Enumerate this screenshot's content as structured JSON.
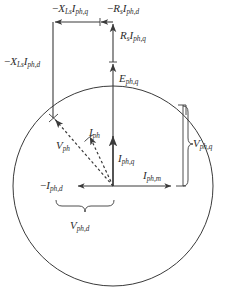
{
  "figure": {
    "type": "phasor-diagram",
    "background_color": "#ffffff",
    "stroke_color": "#3a3a3a"
  },
  "geometry": {
    "width": 229,
    "height": 302,
    "origin": {
      "x": 113,
      "y": 186
    },
    "circle": {
      "cx": 113,
      "cy": 186,
      "r": 100
    },
    "emf_tip": {
      "x": 113,
      "y": 22
    },
    "voltage_tip": {
      "x": 53,
      "y": 118
    },
    "left_vertical_x": 53,
    "top_horizontal_y": 22,
    "rs_iq_split_y": 62,
    "current_tip_y": 134,
    "neg_id_tip_x": 76,
    "im_tip_x": 173
  },
  "labels": {
    "xls_iq": {
      "op": "−",
      "sym": "X",
      "sym_sub": "Ls",
      "sym2": "I",
      "sym2_sub": "ph,q",
      "x": 57,
      "y": 5
    },
    "rs_id": {
      "op": "−",
      "sym": "R",
      "sym_sub": "s",
      "sym2": "I",
      "sym2_sub": "ph,d",
      "x": 110,
      "y": 5
    },
    "rs_iq": {
      "op": "",
      "sym": "R",
      "sym_sub": "s",
      "sym2": "I",
      "sym2_sub": "ph,q",
      "x": 120,
      "y": 30
    },
    "eph_q": {
      "op": "",
      "sym": "E",
      "sym_sub": "ph,q",
      "sym2": "",
      "sym2_sub": "",
      "x": 119,
      "y": 73
    },
    "xls_id": {
      "op": "−",
      "sym": "X",
      "sym_sub": "Ls",
      "sym2": "I",
      "sym2_sub": "ph,d",
      "x": 5,
      "y": 55
    },
    "vph": {
      "op": "",
      "sym": "V",
      "sym_sub": "ph",
      "sym2": "",
      "sym2_sub": "",
      "x": 58,
      "y": 140
    },
    "iph": {
      "op": "",
      "sym": "I",
      "sym_sub": "ph",
      "sym2": "",
      "sym2_sub": "",
      "x": 90,
      "y": 128
    },
    "iph_q": {
      "op": "",
      "sym": "I",
      "sym_sub": "ph,q",
      "sym2": "",
      "sym2_sub": "",
      "x": 118,
      "y": 155
    },
    "iph_m": {
      "op": "",
      "sym": "I",
      "sym_sub": "ph,m",
      "sym2": "",
      "sym2_sub": "",
      "x": 145,
      "y": 172
    },
    "neg_iph_d": {
      "op": "−",
      "sym": "I",
      "sym_sub": "ph,d",
      "sym2": "",
      "sym2_sub": "",
      "x": 43,
      "y": 182
    },
    "vph_q": {
      "op": "",
      "sym": "V",
      "sym_sub": "ph,q",
      "sym2": "",
      "sym2_sub": "",
      "x": 192,
      "y": 140
    },
    "vph_d": {
      "op": "",
      "sym": "V",
      "sym_sub": "ph,d",
      "sym2": "",
      "sym2_sub": "",
      "x": 72,
      "y": 222
    }
  },
  "vectors": [
    {
      "name": "eph_q_axis",
      "kind": "solid-arrow",
      "label_key": "eph_q"
    },
    {
      "name": "rs_iq_segment",
      "kind": "solid-arrow",
      "label_key": "rs_iq"
    },
    {
      "name": "xls_id_segment",
      "kind": "solid-line",
      "label_key": "xls_id"
    },
    {
      "name": "xls_iq_segment",
      "kind": "solid-arrow",
      "label_key": "xls_iq"
    },
    {
      "name": "rs_id_segment",
      "kind": "solid-arrow",
      "label_key": "rs_id"
    },
    {
      "name": "vph_phasor",
      "kind": "dashed-arrow",
      "label_key": "vph"
    },
    {
      "name": "iph_phasor",
      "kind": "dashed-arrow",
      "label_key": "iph"
    },
    {
      "name": "iph_q_component",
      "kind": "solid-arrow",
      "label_key": "iph_q"
    },
    {
      "name": "iph_m_component",
      "kind": "solid-arrow",
      "label_key": "iph_m"
    },
    {
      "name": "neg_iph_d_component",
      "kind": "solid-arrow",
      "label_key": "neg_iph_d"
    }
  ],
  "braces": [
    {
      "name": "vph_q_brace",
      "orientation": "vertical",
      "label_key": "vph_q"
    },
    {
      "name": "vph_d_brace",
      "orientation": "horizontal",
      "label_key": "vph_d"
    }
  ]
}
